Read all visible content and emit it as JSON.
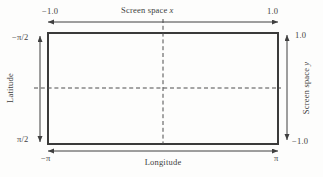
{
  "figure": {
    "colors": {
      "background": "#fdfdfc",
      "line": "#3f3f3f",
      "border": "#3a3a3a",
      "dash": "#4c4c4c",
      "text": "#3d3d3d"
    },
    "top_axis": {
      "label": "Screen space",
      "var": "x",
      "min": "−1.0",
      "max": "1.0"
    },
    "bottom_axis": {
      "label": "Longitude",
      "min": "−π",
      "max": "π"
    },
    "left_axis": {
      "label": "Latitude",
      "min": "−π/2",
      "max": "π/2"
    },
    "right_axis": {
      "label": "Screen space",
      "var": "y",
      "max": "1.0",
      "min": "−1.0"
    }
  }
}
